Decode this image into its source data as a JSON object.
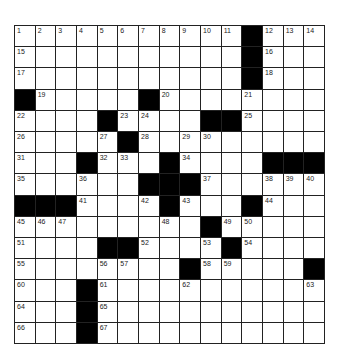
{
  "puzzle": {
    "rows": 15,
    "cols": 15,
    "colors": {
      "block": "#000000",
      "cell": "#ffffff",
      "line": "#222222"
    },
    "blocks": [
      [
        0,
        11
      ],
      [
        1,
        11
      ],
      [
        2,
        11
      ],
      [
        3,
        0
      ],
      [
        3,
        6
      ],
      [
        4,
        4
      ],
      [
        4,
        9
      ],
      [
        4,
        10
      ],
      [
        5,
        5
      ],
      [
        6,
        3
      ],
      [
        6,
        7
      ],
      [
        6,
        12
      ],
      [
        6,
        13
      ],
      [
        6,
        14
      ],
      [
        7,
        6
      ],
      [
        7,
        7
      ],
      [
        7,
        8
      ],
      [
        8,
        0
      ],
      [
        8,
        1
      ],
      [
        8,
        2
      ],
      [
        8,
        7
      ],
      [
        8,
        11
      ],
      [
        9,
        9
      ],
      [
        10,
        4
      ],
      [
        10,
        5
      ],
      [
        10,
        10
      ],
      [
        11,
        8
      ],
      [
        11,
        14
      ],
      [
        12,
        3
      ],
      [
        13,
        3
      ],
      [
        14,
        3
      ]
    ],
    "numbers": [
      {
        "r": 0,
        "c": 0,
        "n": "1"
      },
      {
        "r": 0,
        "c": 1,
        "n": "2"
      },
      {
        "r": 0,
        "c": 2,
        "n": "3"
      },
      {
        "r": 0,
        "c": 3,
        "n": "4"
      },
      {
        "r": 0,
        "c": 4,
        "n": "5"
      },
      {
        "r": 0,
        "c": 5,
        "n": "6"
      },
      {
        "r": 0,
        "c": 6,
        "n": "7"
      },
      {
        "r": 0,
        "c": 7,
        "n": "8"
      },
      {
        "r": 0,
        "c": 8,
        "n": "9"
      },
      {
        "r": 0,
        "c": 9,
        "n": "10"
      },
      {
        "r": 0,
        "c": 10,
        "n": "11"
      },
      {
        "r": 0,
        "c": 12,
        "n": "12"
      },
      {
        "r": 0,
        "c": 13,
        "n": "13"
      },
      {
        "r": 0,
        "c": 14,
        "n": "14"
      },
      {
        "r": 1,
        "c": 0,
        "n": "15"
      },
      {
        "r": 1,
        "c": 12,
        "n": "16"
      },
      {
        "r": 2,
        "c": 0,
        "n": "17"
      },
      {
        "r": 2,
        "c": 12,
        "n": "18"
      },
      {
        "r": 3,
        "c": 1,
        "n": "19"
      },
      {
        "r": 3,
        "c": 7,
        "n": "20"
      },
      {
        "r": 3,
        "c": 11,
        "n": "21"
      },
      {
        "r": 4,
        "c": 0,
        "n": "22"
      },
      {
        "r": 4,
        "c": 5,
        "n": "23"
      },
      {
        "r": 4,
        "c": 6,
        "n": "24"
      },
      {
        "r": 4,
        "c": 11,
        "n": "25"
      },
      {
        "r": 5,
        "c": 0,
        "n": "26"
      },
      {
        "r": 5,
        "c": 4,
        "n": "27"
      },
      {
        "r": 5,
        "c": 6,
        "n": "28"
      },
      {
        "r": 5,
        "c": 8,
        "n": "29"
      },
      {
        "r": 5,
        "c": 9,
        "n": "30"
      },
      {
        "r": 6,
        "c": 0,
        "n": "31"
      },
      {
        "r": 6,
        "c": 4,
        "n": "32"
      },
      {
        "r": 6,
        "c": 5,
        "n": "33"
      },
      {
        "r": 6,
        "c": 8,
        "n": "34"
      },
      {
        "r": 7,
        "c": 0,
        "n": "35"
      },
      {
        "r": 7,
        "c": 3,
        "n": "36"
      },
      {
        "r": 7,
        "c": 9,
        "n": "37"
      },
      {
        "r": 7,
        "c": 12,
        "n": "38"
      },
      {
        "r": 7,
        "c": 13,
        "n": "39"
      },
      {
        "r": 7,
        "c": 14,
        "n": "40"
      },
      {
        "r": 8,
        "c": 3,
        "n": "41"
      },
      {
        "r": 8,
        "c": 6,
        "n": "42"
      },
      {
        "r": 8,
        "c": 8,
        "n": "43"
      },
      {
        "r": 8,
        "c": 12,
        "n": "44"
      },
      {
        "r": 9,
        "c": 0,
        "n": "45"
      },
      {
        "r": 9,
        "c": 1,
        "n": "46"
      },
      {
        "r": 9,
        "c": 2,
        "n": "47"
      },
      {
        "r": 9,
        "c": 7,
        "n": "48"
      },
      {
        "r": 9,
        "c": 10,
        "n": "49"
      },
      {
        "r": 9,
        "c": 11,
        "n": "50"
      },
      {
        "r": 10,
        "c": 0,
        "n": "51"
      },
      {
        "r": 10,
        "c": 6,
        "n": "52"
      },
      {
        "r": 10,
        "c": 9,
        "n": "53"
      },
      {
        "r": 10,
        "c": 11,
        "n": "54"
      },
      {
        "r": 11,
        "c": 0,
        "n": "55"
      },
      {
        "r": 11,
        "c": 4,
        "n": "56"
      },
      {
        "r": 11,
        "c": 5,
        "n": "57"
      },
      {
        "r": 11,
        "c": 9,
        "n": "58"
      },
      {
        "r": 11,
        "c": 10,
        "n": "59"
      },
      {
        "r": 12,
        "c": 0,
        "n": "60"
      },
      {
        "r": 12,
        "c": 4,
        "n": "61"
      },
      {
        "r": 12,
        "c": 8,
        "n": "62"
      },
      {
        "r": 12,
        "c": 14,
        "n": "63"
      },
      {
        "r": 13,
        "c": 0,
        "n": "64"
      },
      {
        "r": 13,
        "c": 4,
        "n": "65"
      },
      {
        "r": 14,
        "c": 0,
        "n": "66"
      },
      {
        "r": 14,
        "c": 4,
        "n": "67"
      }
    ]
  }
}
